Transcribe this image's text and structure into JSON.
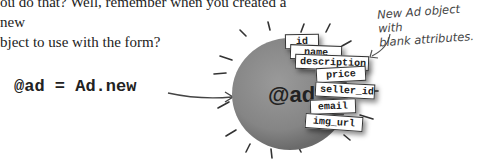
{
  "intro_text": "ou do that? Well, remember when you created a new\nbject to use with the form?",
  "code": "@ad = Ad.new",
  "annotation": "New Ad object with\nblank attributes.",
  "object": {
    "label": "@ad",
    "attributes": [
      "id",
      "name",
      "description",
      "price",
      "seller_id",
      "email",
      "img_url"
    ]
  }
}
